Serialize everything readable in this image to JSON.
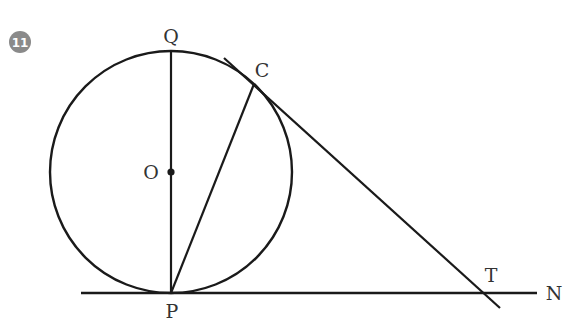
{
  "problem": {
    "number": "11",
    "badge_color": "#8a8a8a"
  },
  "diagram": {
    "stroke_color": "#1a1a1a",
    "label_color": "#333333",
    "circle": {
      "center_label": "O",
      "cx": 171,
      "cy": 172,
      "r": 121
    },
    "points": {
      "Q": {
        "label": "Q",
        "x": 171,
        "y": 51
      },
      "O": {
        "label": "O",
        "x": 171,
        "y": 172
      },
      "P": {
        "label": "P",
        "x": 171,
        "y": 293
      },
      "C": {
        "label": "C",
        "x": 254,
        "y": 84
      },
      "T": {
        "label": "T",
        "x": 483,
        "y": 293
      },
      "N": {
        "label": "N",
        "x": 537,
        "y": 293
      }
    },
    "segments": [
      {
        "name": "diameter-QP",
        "from": "Q",
        "to": "P"
      },
      {
        "name": "chord-PC",
        "from": "P",
        "to": "C"
      },
      {
        "name": "tangent-line-at-C",
        "through": [
          "C",
          "T"
        ]
      },
      {
        "name": "tangent-line-PN",
        "through": [
          "P",
          "T",
          "N"
        ]
      }
    ]
  }
}
